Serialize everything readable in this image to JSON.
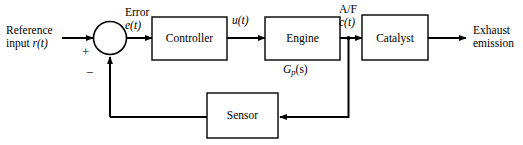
{
  "diagram": {
    "blocks": [
      {
        "id": "controller",
        "label": "Controller"
      },
      {
        "id": "engine",
        "label": "Engine"
      },
      {
        "id": "catalyst",
        "label": "Catalyst"
      },
      {
        "id": "sensor",
        "label": "Sensor"
      }
    ],
    "input": {
      "line1": "Reference",
      "line2_prefix": "input ",
      "line2_var": "r(t)"
    },
    "output": {
      "line1": "Exhaust",
      "line2": "emission"
    },
    "signals": {
      "error_label": "Error",
      "error_var": "e(t)",
      "control_var": "u(t)",
      "af_label": "A/F",
      "af_var": "c(t)"
    },
    "plant_transfer": {
      "fn": "G",
      "sub": "p",
      "arg": "(s)"
    },
    "summing_junction": {
      "positive_sign": "+",
      "negative_sign": "−"
    },
    "colors": {
      "line": "#000000",
      "text": "#000000",
      "background": "#ffffff"
    }
  }
}
